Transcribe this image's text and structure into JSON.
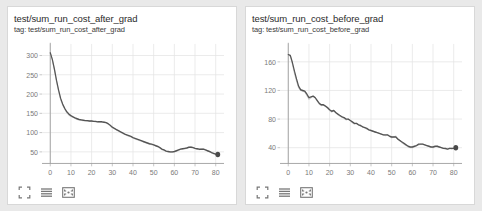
{
  "theme": {
    "page_background": "#e9e9e9",
    "card_background": "#ffffff",
    "card_border": "#d8d8d8",
    "smoothed_line_color": "#545454",
    "raw_line_color": "#c9c9c9",
    "grid_color": "#e4e4e4",
    "tick_text_color": "#7a7a7a"
  },
  "toolbar": {
    "icons": [
      {
        "name": "expand-icon",
        "glyph": "expand"
      },
      {
        "name": "data-table-icon",
        "glyph": "lines"
      },
      {
        "name": "fit-domain-icon",
        "glyph": "fit"
      }
    ]
  },
  "cards": [
    {
      "title": "test/sum_run_cost_after_grad",
      "tag": "tag: test/sum_run_cost_after_grad"
    },
    {
      "title": "test/sum_run_cost_before_grad",
      "tag": "tag: test/sum_run_cost_before_grad"
    }
  ],
  "chart_data": [
    {
      "type": "line",
      "title": "test/sum_run_cost_after_grad",
      "subtitle": "tag: test/sum_run_cost_after_grad",
      "xlabel": "",
      "ylabel": "",
      "xlim": [
        -4,
        84
      ],
      "ylim": [
        20,
        330
      ],
      "xticks": [
        0,
        10,
        20,
        30,
        40,
        50,
        60,
        70,
        80
      ],
      "yticks": [
        50,
        100,
        150,
        200,
        250,
        300
      ],
      "grid": true,
      "legend": "none",
      "x": [
        0,
        1,
        2,
        3,
        4,
        5,
        6,
        7,
        8,
        9,
        10,
        11,
        12,
        13,
        14,
        15,
        16,
        17,
        18,
        19,
        20,
        21,
        22,
        23,
        24,
        25,
        26,
        27,
        28,
        29,
        30,
        31,
        32,
        33,
        34,
        35,
        36,
        37,
        38,
        39,
        40,
        41,
        42,
        43,
        44,
        45,
        46,
        47,
        48,
        49,
        50,
        51,
        52,
        53,
        54,
        55,
        56,
        57,
        58,
        59,
        60,
        61,
        62,
        63,
        64,
        65,
        66,
        67,
        68,
        69,
        70,
        71,
        72,
        73,
        74,
        75,
        76,
        77,
        78,
        79,
        80,
        81
      ],
      "series": [
        {
          "name": "raw",
          "style": "faint",
          "values": [
            307,
            288,
            262,
            233,
            208,
            186,
            172,
            161,
            152,
            146,
            142,
            140,
            137,
            134,
            133,
            132,
            131,
            131,
            130,
            129,
            130,
            129,
            128,
            128,
            128,
            127,
            127,
            126,
            122,
            118,
            113,
            110,
            107,
            104,
            101,
            98,
            96,
            93,
            91,
            89,
            86,
            84,
            82,
            80,
            78,
            76,
            74,
            72,
            70,
            69,
            68,
            66,
            64,
            60,
            56,
            54,
            52,
            50,
            49,
            49,
            50,
            52,
            54,
            57,
            58,
            58,
            60,
            62,
            63,
            62,
            59,
            57,
            56,
            57,
            58,
            56,
            53,
            50,
            48,
            45,
            44,
            43
          ]
        },
        {
          "name": "smoothed",
          "style": "solid",
          "values": [
            307,
            290,
            265,
            236,
            211,
            189,
            174,
            163,
            154,
            148,
            144,
            141,
            138,
            136,
            134,
            133,
            132,
            131,
            131,
            130,
            130,
            129,
            129,
            128,
            128,
            128,
            127,
            126,
            123,
            119,
            114,
            111,
            108,
            105,
            102,
            99,
            96,
            94,
            92,
            90,
            87,
            85,
            83,
            81,
            79,
            77,
            75,
            73,
            71,
            70,
            68,
            66,
            64,
            61,
            57,
            55,
            52,
            51,
            50,
            50,
            51,
            53,
            55,
            57,
            58,
            59,
            60,
            62,
            62,
            61,
            59,
            58,
            57,
            57,
            57,
            55,
            53,
            51,
            48,
            46,
            44,
            43
          ]
        }
      ],
      "endpoint": {
        "x": 81,
        "y": 43
      }
    },
    {
      "type": "line",
      "title": "test/sum_run_cost_before_grad",
      "subtitle": "tag: test/sum_run_cost_before_grad",
      "xlabel": "",
      "ylabel": "",
      "xlim": [
        -4,
        84
      ],
      "ylim": [
        18,
        185
      ],
      "xticks": [
        0,
        10,
        20,
        30,
        40,
        50,
        60,
        70,
        80
      ],
      "yticks": [
        40,
        80,
        120,
        160
      ],
      "grid": true,
      "legend": "none",
      "x": [
        0,
        1,
        2,
        3,
        4,
        5,
        6,
        7,
        8,
        9,
        10,
        11,
        12,
        13,
        14,
        15,
        16,
        17,
        18,
        19,
        20,
        21,
        22,
        23,
        24,
        25,
        26,
        27,
        28,
        29,
        30,
        31,
        32,
        33,
        34,
        35,
        36,
        37,
        38,
        39,
        40,
        41,
        42,
        43,
        44,
        45,
        46,
        47,
        48,
        49,
        50,
        51,
        52,
        53,
        54,
        55,
        56,
        57,
        58,
        59,
        60,
        61,
        62,
        63,
        64,
        65,
        66,
        67,
        68,
        69,
        70,
        71,
        72,
        73,
        74,
        75,
        76,
        77,
        78,
        79,
        80,
        81
      ],
      "series": [
        {
          "name": "raw",
          "style": "faint",
          "values": [
            170,
            168,
            157,
            144,
            133,
            124,
            120,
            119,
            118,
            113,
            108,
            110,
            112,
            110,
            105,
            101,
            99,
            100,
            98,
            95,
            92,
            90,
            92,
            89,
            86,
            84,
            83,
            81,
            79,
            80,
            78,
            75,
            73,
            74,
            72,
            70,
            69,
            68,
            66,
            65,
            64,
            63,
            62,
            61,
            60,
            59,
            58,
            57,
            58,
            56,
            54,
            55,
            56,
            52,
            50,
            47,
            45,
            43,
            41,
            40,
            40,
            41,
            43,
            44,
            45,
            45,
            44,
            43,
            42,
            41,
            40,
            41,
            42,
            41,
            40,
            39,
            38,
            38,
            39,
            38,
            39,
            40
          ]
        },
        {
          "name": "smoothed",
          "style": "solid",
          "values": [
            170,
            169,
            159,
            147,
            136,
            126,
            121,
            120,
            119,
            115,
            110,
            111,
            112,
            110,
            106,
            102,
            100,
            100,
            98,
            96,
            93,
            91,
            92,
            89,
            87,
            85,
            83,
            82,
            80,
            80,
            78,
            76,
            74,
            74,
            72,
            71,
            69,
            68,
            67,
            65,
            64,
            63,
            62,
            61,
            60,
            59,
            58,
            58,
            58,
            56,
            55,
            55,
            55,
            52,
            50,
            48,
            46,
            44,
            42,
            41,
            41,
            42,
            43,
            45,
            45,
            45,
            44,
            43,
            42,
            41,
            41,
            42,
            42,
            41,
            40,
            39,
            39,
            38,
            39,
            39,
            39,
            40
          ]
        }
      ],
      "endpoint": {
        "x": 81,
        "y": 40
      }
    }
  ]
}
